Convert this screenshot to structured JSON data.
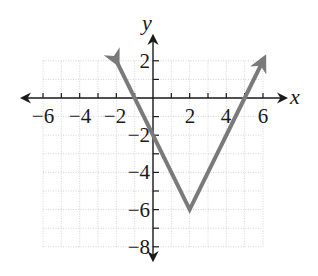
{
  "chart_data": {
    "type": "line",
    "title": "",
    "xlabel": "x",
    "ylabel": "y",
    "xlim": [
      -6,
      6
    ],
    "ylim": [
      -8,
      2
    ],
    "grid": true,
    "grid_step": 1,
    "x_ticks": [
      -6,
      -5,
      -4,
      -3,
      -2,
      -1,
      1,
      2,
      3,
      4,
      5,
      6
    ],
    "x_tick_labels": [
      "-6",
      "-4",
      "-2",
      "2",
      "4",
      "6"
    ],
    "y_ticks": [
      2,
      1,
      -1,
      -2,
      -3,
      -4,
      -5,
      -6,
      -7,
      -8
    ],
    "y_tick_labels": [
      "2",
      "-2",
      "-4",
      "-6",
      "-8"
    ],
    "series": [
      {
        "name": "absolute value function",
        "equation": "y = 2|x - 2| - 6",
        "color": "#7a7a7a",
        "x": [
          -2,
          0,
          2,
          5,
          6
        ],
        "y": [
          2,
          -2,
          -6,
          0,
          2
        ],
        "vertex": [
          2,
          -6
        ],
        "arrows_at_ends": true
      }
    ]
  },
  "labels": {
    "x_axis": "x",
    "y_axis": "y",
    "x_tick_neg6": "−6",
    "x_tick_neg4": "−4",
    "x_tick_neg2": "−2",
    "x_tick_2": "2",
    "x_tick_4": "4",
    "x_tick_6": "6",
    "y_tick_2": "2",
    "y_tick_neg2": "−2",
    "y_tick_neg4": "−4",
    "y_tick_neg6": "−6",
    "y_tick_neg8": "−8"
  }
}
